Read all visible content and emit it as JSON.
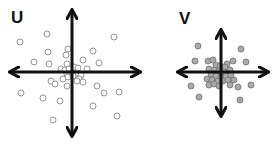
{
  "panels": [
    {
      "label": "U",
      "center": [
        72,
        72
      ],
      "axes": {
        "x_from": 12,
        "x_to": 138,
        "y_from": 12,
        "y_to": 134
      },
      "point_style": "hollow",
      "point_fill": "#ffffff",
      "point_stroke": "#888888",
      "points": [
        [
          20,
          42
        ],
        [
          47,
          34
        ],
        [
          114,
          37
        ],
        [
          34,
          62
        ],
        [
          48,
          52
        ],
        [
          68,
          49
        ],
        [
          66,
          55
        ],
        [
          93,
          51
        ],
        [
          49,
          64
        ],
        [
          67,
          64
        ],
        [
          99,
          63
        ],
        [
          83,
          60
        ],
        [
          61,
          69
        ],
        [
          65,
          70
        ],
        [
          69,
          69
        ],
        [
          74,
          67
        ],
        [
          78,
          68
        ],
        [
          87,
          69
        ],
        [
          67,
          74
        ],
        [
          72,
          73
        ],
        [
          77,
          73
        ],
        [
          81,
          75
        ],
        [
          63,
          79
        ],
        [
          68,
          77
        ],
        [
          73,
          76
        ],
        [
          79,
          79
        ],
        [
          83,
          82
        ],
        [
          51,
          81
        ],
        [
          55,
          84
        ],
        [
          67,
          86
        ],
        [
          77,
          81
        ],
        [
          97,
          86
        ],
        [
          21,
          93
        ],
        [
          43,
          98
        ],
        [
          60,
          101
        ],
        [
          104,
          93
        ],
        [
          119,
          92
        ],
        [
          93,
          106
        ],
        [
          117,
          116
        ],
        [
          53,
          120
        ]
      ]
    },
    {
      "label": "V",
      "center": [
        221,
        72
      ],
      "axes": {
        "x_from": 180,
        "x_to": 266,
        "y_from": 32,
        "y_to": 114
      },
      "point_style": "filled",
      "point_fill": "#aaaaaa",
      "point_stroke": "#777777",
      "points": [
        [
          198,
          46
        ],
        [
          241,
          49
        ],
        [
          195,
          61
        ],
        [
          246,
          62
        ],
        [
          208,
          61
        ],
        [
          213,
          60
        ],
        [
          227,
          64
        ],
        [
          233,
          61
        ],
        [
          216,
          65
        ],
        [
          220,
          66
        ],
        [
          225,
          67
        ],
        [
          209,
          69
        ],
        [
          214,
          70
        ],
        [
          219,
          71
        ],
        [
          224,
          72
        ],
        [
          230,
          70
        ],
        [
          211,
          74
        ],
        [
          216,
          76
        ],
        [
          221,
          77
        ],
        [
          226,
          76
        ],
        [
          231,
          75
        ],
        [
          207,
          79
        ],
        [
          212,
          80
        ],
        [
          218,
          81
        ],
        [
          223,
          81
        ],
        [
          228,
          80
        ],
        [
          234,
          80
        ],
        [
          209,
          85
        ],
        [
          214,
          84
        ],
        [
          219,
          86
        ],
        [
          230,
          85
        ],
        [
          238,
          87
        ],
        [
          191,
          86
        ],
        [
          251,
          85
        ],
        [
          199,
          97
        ],
        [
          240,
          100
        ]
      ]
    }
  ]
}
